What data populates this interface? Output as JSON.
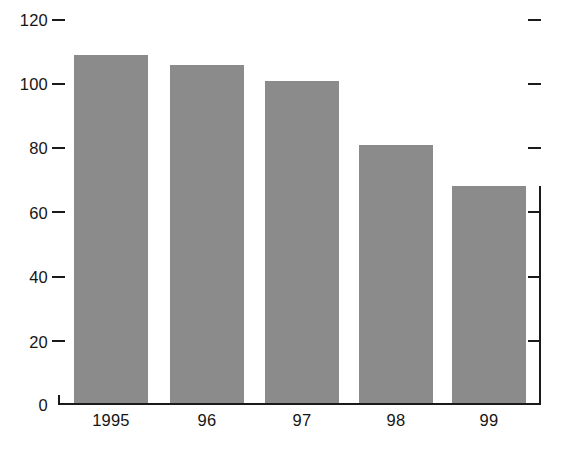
{
  "chart_data": {
    "type": "bar",
    "title": "",
    "subtitle": "",
    "xlabel": "",
    "ylabel": "",
    "categories": [
      "1995",
      "96",
      "97",
      "98",
      "99"
    ],
    "values": [
      109,
      106,
      101,
      81,
      68
    ],
    "series": [
      {
        "name": "",
        "values": [
          109,
          106,
          101,
          81,
          68
        ]
      }
    ],
    "ylim": [
      0,
      120
    ],
    "yticks": [
      0,
      20,
      40,
      60,
      80,
      100,
      120
    ],
    "ytick_labels": [
      "0",
      "20",
      "40",
      "60",
      "80",
      "100",
      "120"
    ],
    "xtick_labels": [
      "1995",
      "96",
      "97",
      "98",
      "99"
    ],
    "grid": false,
    "legend": null,
    "legend_position": "none",
    "bar_color": "#8b8b8b",
    "axis_color": "#1a1a1a",
    "text_color": "#151515",
    "background_color": "#ffffff",
    "annotations": [],
    "right_axis_ticks": [
      0,
      20,
      40,
      60,
      80,
      100,
      120
    ]
  }
}
